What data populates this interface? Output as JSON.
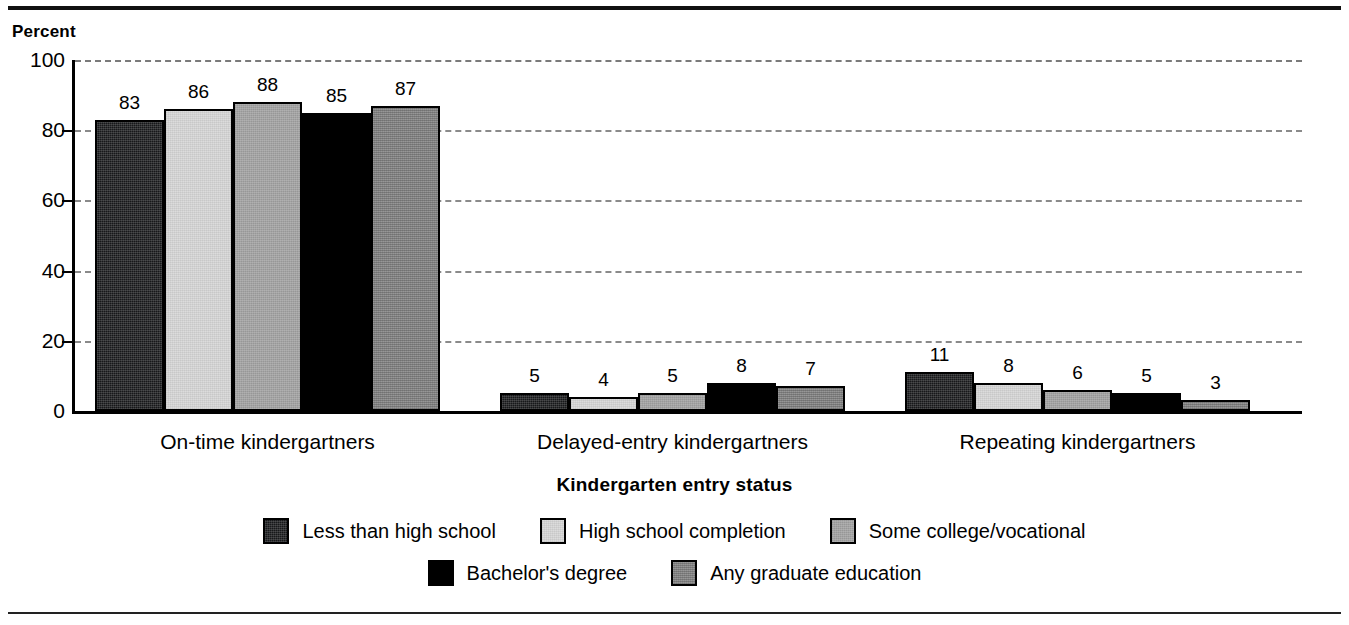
{
  "rules": {
    "top": "top-rule",
    "bottom": "bottom-rule"
  },
  "chart_data": {
    "type": "bar",
    "title": "",
    "ylabel": "Percent",
    "xlabel": "Kindergarten entry status",
    "ylim": [
      0,
      100
    ],
    "yticks": [
      0,
      20,
      40,
      60,
      80,
      100
    ],
    "grid": true,
    "legend_position": "bottom",
    "categories": [
      "On-time kindergartners",
      "Delayed-entry kindergartners",
      "Repeating kindergartners"
    ],
    "series": [
      {
        "name": "Less than high school",
        "values": [
          83,
          5,
          11
        ],
        "color": "#17181a"
      },
      {
        "name": "High school completion",
        "values": [
          86,
          4,
          8
        ],
        "color": "#dcdcdc"
      },
      {
        "name": "Some college/vocational",
        "values": [
          88,
          5,
          6
        ],
        "color": "#a3a3a3"
      },
      {
        "name": "Bachelor's degree",
        "values": [
          85,
          8,
          5
        ],
        "color": "#000000"
      },
      {
        "name": "Any graduate education",
        "values": [
          87,
          7,
          3
        ],
        "color": "#8b8b8b"
      }
    ]
  },
  "legend": {
    "row1": [
      "Less than high school",
      "High school completion",
      "Some college/vocational"
    ],
    "row2": [
      "Bachelor's degree",
      "Any graduate education"
    ]
  }
}
